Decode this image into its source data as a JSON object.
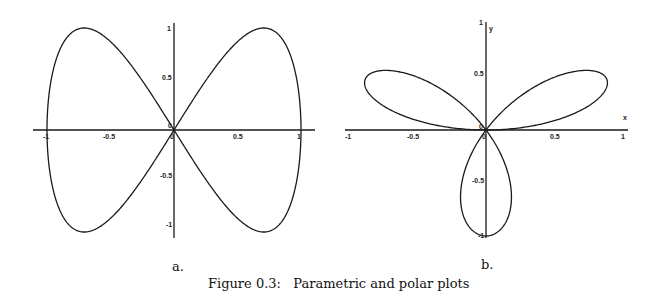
{
  "figure": {
    "caption": "Figure 0.3:   Parametric and polar plots",
    "panel_a_label": "a.",
    "panel_b_label": "b."
  },
  "chart_data": [
    {
      "type": "line",
      "panel": "a",
      "description": "Parametric figure-eight curve x = sin(t), y = sin(2t), t in [0, 2π]",
      "parametric": {
        "x": "sin(t)",
        "y": "sin(2t)",
        "t_range": [
          0,
          6.2832
        ]
      },
      "key_points": [
        {
          "x": 0,
          "y": 0
        },
        {
          "x": 0.707,
          "y": 1
        },
        {
          "x": 1,
          "y": 0
        },
        {
          "x": 0.707,
          "y": -1
        },
        {
          "x": -0.707,
          "y": 1
        },
        {
          "x": -1,
          "y": 0
        },
        {
          "x": -0.707,
          "y": -1
        }
      ],
      "x_ticks": [
        "-1",
        "-0.5",
        "0",
        "0.5",
        "1"
      ],
      "y_ticks": [
        "1",
        "0.5",
        "0",
        "-0.5",
        "-1"
      ],
      "xlim": [
        -1.1,
        1.1
      ],
      "ylim": [
        -1.1,
        1.05
      ],
      "xlabel": "",
      "ylabel": "",
      "grid": false,
      "legend": null,
      "title": ""
    },
    {
      "type": "line",
      "panel": "b",
      "description": "Polar three-leaved rose r = sin(3θ), θ in [0, π]",
      "polar": {
        "r": "sin(3θ)",
        "theta_range": [
          0,
          3.1416
        ]
      },
      "petal_tips": [
        {
          "x": 0.866,
          "y": 0.5
        },
        {
          "x": -0.866,
          "y": 0.5
        },
        {
          "x": 0,
          "y": -1
        }
      ],
      "x_ticks": [
        "-1",
        "-0.5",
        "0",
        "0.5",
        "1"
      ],
      "y_ticks": [
        "1",
        "0.5",
        "0",
        "-0.5",
        "-1"
      ],
      "xlim": [
        -1.02,
        1.03
      ],
      "ylim": [
        -1.05,
        1.02
      ],
      "xlabel": "x",
      "ylabel": "y",
      "grid": false,
      "legend": null,
      "title": ""
    }
  ]
}
